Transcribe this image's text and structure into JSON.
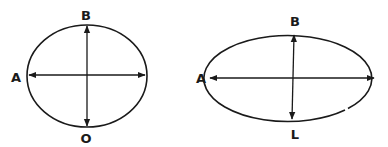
{
  "figures": [
    {
      "name": "circle-shape",
      "labels": {
        "top": "B",
        "left": "A",
        "bottom": "O"
      }
    },
    {
      "name": "ellipse-shape",
      "labels": {
        "top": "B",
        "left": "A",
        "bottom": "L"
      }
    }
  ],
  "colors": {
    "stroke": "#1a1a1a",
    "background": "#ffffff"
  }
}
